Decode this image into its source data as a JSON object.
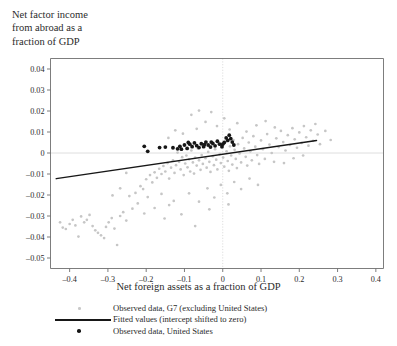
{
  "figure": {
    "y_axis_title_lines": [
      "Net factor income",
      "from abroad as a",
      "fraction of GDP"
    ],
    "x_axis_title": "Net foreign assets as a fraction of GDP"
  },
  "legend": {
    "items": [
      {
        "marker": "gray-dot-marker",
        "label": "Observed data, G7 (excluding United States)"
      },
      {
        "marker": "black-line-marker",
        "label": "Fitted values (intercept shifted to zero)"
      },
      {
        "marker": "black-dot-marker",
        "label": "Observed data, United States"
      }
    ]
  },
  "colors": {
    "g7_points": "#c6c6c6",
    "us_points": "#161616",
    "fit_line": "#171717",
    "axis": "#6e6e6e",
    "gridline": "#dedede"
  },
  "chart_data": {
    "type": "scatter",
    "title": "",
    "xlabel": "Net foreign assets as a fraction of GDP",
    "ylabel": "Net factor income from abroad as a fraction of GDP",
    "xlim": [
      -0.45,
      0.42
    ],
    "ylim": [
      -0.055,
      0.045
    ],
    "xticks": [
      -0.4,
      -0.3,
      -0.2,
      -0.1,
      0,
      0.1,
      0.2,
      0.3,
      0.4
    ],
    "xticklabels": [
      "–0.4",
      "–0.3",
      "–0.2",
      "–0.1",
      "0",
      "0.1",
      "0.2",
      "0.3",
      "0.4"
    ],
    "yticks": [
      0.04,
      0.03,
      0.02,
      0.01,
      0,
      -0.01,
      -0.02,
      -0.03,
      -0.04,
      -0.05
    ],
    "yticklabels": [
      "0.04",
      "0.03",
      "0.02",
      "0.01",
      "0",
      "–0.01",
      "–0.02",
      "–0.03",
      "–0.04",
      "–0.05"
    ],
    "grid": false,
    "zero_lines": {
      "horizontal_y": 0,
      "vertical_x": 0
    },
    "legend_position": "below",
    "series": [
      {
        "name": "Observed data, G7 (excluding United States)",
        "marker": "circle",
        "color": "#c6c6c6",
        "points": [
          [
            -0.425,
            -0.033
          ],
          [
            -0.418,
            -0.0355
          ],
          [
            -0.41,
            -0.0362
          ],
          [
            -0.4,
            -0.0338
          ],
          [
            -0.392,
            -0.0318
          ],
          [
            -0.385,
            -0.0345
          ],
          [
            -0.377,
            -0.0398
          ],
          [
            -0.37,
            -0.0302
          ],
          [
            -0.362,
            -0.033
          ],
          [
            -0.355,
            -0.0318
          ],
          [
            -0.348,
            -0.0295
          ],
          [
            -0.34,
            -0.0348
          ],
          [
            -0.333,
            -0.0368
          ],
          [
            -0.326,
            -0.038
          ],
          [
            -0.318,
            -0.0392
          ],
          [
            -0.31,
            -0.0405
          ],
          [
            -0.305,
            -0.0352
          ],
          [
            -0.298,
            -0.033
          ],
          [
            -0.29,
            -0.031
          ],
          [
            -0.283,
            -0.036
          ],
          [
            -0.276,
            -0.0438
          ],
          [
            -0.268,
            -0.03
          ],
          [
            -0.26,
            -0.0282
          ],
          [
            -0.252,
            -0.0322
          ],
          [
            -0.244,
            -0.0205
          ],
          [
            -0.236,
            -0.0265
          ],
          [
            -0.228,
            -0.019
          ],
          [
            -0.222,
            -0.024
          ],
          [
            -0.215,
            -0.0158
          ],
          [
            -0.208,
            -0.0172
          ],
          [
            -0.2,
            -0.0125
          ],
          [
            -0.196,
            -0.021
          ],
          [
            -0.19,
            -0.0105
          ],
          [
            -0.184,
            -0.014
          ],
          [
            -0.178,
            -0.0092
          ],
          [
            -0.172,
            -0.0118
          ],
          [
            -0.166,
            -0.0075
          ],
          [
            -0.16,
            -0.01
          ],
          [
            -0.155,
            -0.0062
          ],
          [
            -0.15,
            -0.0088
          ],
          [
            -0.144,
            -0.0048
          ],
          [
            -0.14,
            -0.0122
          ],
          [
            -0.135,
            -0.007
          ],
          [
            -0.13,
            -0.0035
          ],
          [
            -0.126,
            -0.0095
          ],
          [
            -0.122,
            -0.0058
          ],
          [
            -0.118,
            0.0002
          ],
          [
            -0.114,
            -0.0042
          ],
          [
            -0.11,
            -0.0078
          ],
          [
            -0.106,
            -0.002
          ],
          [
            -0.102,
            -0.0105
          ],
          [
            -0.098,
            -0.005
          ],
          [
            -0.095,
            -0.0012
          ],
          [
            -0.092,
            -0.0068
          ],
          [
            -0.088,
            -0.003
          ],
          [
            -0.085,
            -0.0088
          ],
          [
            -0.082,
            0.0012
          ],
          [
            -0.078,
            -0.0045
          ],
          [
            -0.075,
            -0.0098
          ],
          [
            -0.072,
            -0.0022
          ],
          [
            -0.068,
            -0.006
          ],
          [
            -0.065,
            0.0022
          ],
          [
            -0.062,
            -0.0035
          ],
          [
            -0.058,
            -0.008
          ],
          [
            -0.055,
            -0.001
          ],
          [
            -0.052,
            -0.0052
          ],
          [
            -0.048,
            0.003
          ],
          [
            -0.045,
            -0.0025
          ],
          [
            -0.042,
            -0.007
          ],
          [
            -0.038,
            0.0005
          ],
          [
            -0.035,
            -0.0042
          ],
          [
            -0.032,
            -0.009
          ],
          [
            -0.029,
            0.0038
          ],
          [
            -0.026,
            -0.0015
          ],
          [
            -0.023,
            -0.0058
          ],
          [
            -0.02,
            0.0018
          ],
          [
            -0.017,
            -0.0032
          ],
          [
            -0.014,
            -0.0078
          ],
          [
            -0.011,
            0.0045
          ],
          [
            -0.008,
            -0.0005
          ],
          [
            -0.005,
            -0.0048
          ],
          [
            -0.002,
            0.0025
          ],
          [
            0.001,
            -0.0022
          ],
          [
            0.004,
            -0.0065
          ],
          [
            0.007,
            0.0052
          ],
          [
            0.01,
            0.0008
          ],
          [
            0.013,
            -0.0038
          ],
          [
            0.016,
            -0.0085
          ],
          [
            0.019,
            0.0032
          ],
          [
            0.022,
            -0.0012
          ],
          [
            0.025,
            -0.0055
          ],
          [
            0.028,
            0.0062
          ],
          [
            0.031,
            0.0015
          ],
          [
            0.034,
            -0.0028
          ],
          [
            0.037,
            -0.0072
          ],
          [
            0.04,
            0.0042
          ],
          [
            0.044,
            -0.0002
          ],
          [
            0.048,
            -0.0045
          ],
          [
            0.052,
            0.0072
          ],
          [
            0.056,
            0.0022
          ],
          [
            0.06,
            -0.0018
          ],
          [
            0.064,
            -0.006
          ],
          [
            0.068,
            0.005
          ],
          [
            0.072,
            0.0008
          ],
          [
            0.076,
            -0.0035
          ],
          [
            0.08,
            0.008
          ],
          [
            0.085,
            0.003
          ],
          [
            0.09,
            -0.001
          ],
          [
            0.095,
            -0.0052
          ],
          [
            0.1,
            0.006
          ],
          [
            0.105,
            0.0018
          ],
          [
            0.11,
            -0.0028
          ],
          [
            0.116,
            0.009
          ],
          [
            0.122,
            0.004
          ],
          [
            0.128,
            0.0
          ],
          [
            0.134,
            -0.0042
          ],
          [
            0.14,
            0.007
          ],
          [
            0.146,
            0.0028
          ],
          [
            0.152,
            0.0105
          ],
          [
            0.158,
            0.0052
          ],
          [
            0.164,
            0.0012
          ],
          [
            0.17,
            0.0085
          ],
          [
            0.176,
            0.0038
          ],
          [
            0.182,
            0.0118
          ],
          [
            0.188,
            0.0065
          ],
          [
            0.194,
            0.0025
          ],
          [
            0.2,
            0.0098
          ],
          [
            0.206,
            0.0048
          ],
          [
            0.212,
            0.0128
          ],
          [
            0.218,
            0.0075
          ],
          [
            0.224,
            0.0035
          ],
          [
            0.23,
            0.0108
          ],
          [
            0.236,
            0.0058
          ],
          [
            0.242,
            0.0138
          ],
          [
            0.248,
            0.0088
          ],
          [
            0.254,
            0.0042
          ],
          [
            -0.082,
            0.0182
          ],
          [
            -0.062,
            0.0202
          ],
          [
            -0.03,
            0.0195
          ],
          [
            -0.045,
            0.0148
          ],
          [
            -0.015,
            0.0128
          ],
          [
            -0.068,
            0.0115
          ],
          [
            0.004,
            0.0165
          ],
          [
            0.018,
            0.0112
          ],
          [
            -0.104,
            0.0092
          ],
          [
            -0.124,
            0.0108
          ],
          [
            -0.142,
            0.0072
          ],
          [
            0.038,
            0.0142
          ],
          [
            0.062,
            0.0102
          ],
          [
            0.088,
            0.0132
          ],
          [
            0.112,
            0.0152
          ],
          [
            0.136,
            0.0122
          ],
          [
            -0.252,
            -0.0095
          ],
          [
            -0.268,
            -0.0168
          ],
          [
            -0.288,
            -0.0202
          ],
          [
            -0.205,
            -0.0288
          ],
          [
            -0.178,
            -0.0262
          ],
          [
            -0.152,
            -0.0312
          ],
          [
            -0.128,
            -0.0228
          ],
          [
            -0.108,
            -0.0292
          ],
          [
            -0.088,
            -0.0192
          ],
          [
            -0.062,
            -0.0232
          ],
          [
            -0.04,
            -0.0168
          ],
          [
            -0.022,
            -0.0212
          ],
          [
            -0.005,
            -0.0152
          ],
          [
            0.012,
            -0.0192
          ],
          [
            0.03,
            -0.0138
          ],
          [
            0.048,
            -0.0172
          ],
          [
            0.07,
            -0.0122
          ],
          [
            0.092,
            -0.0152
          ],
          [
            -0.16,
            -0.0195
          ],
          [
            -0.14,
            -0.0248
          ],
          [
            0.16,
            -0.0048
          ],
          [
            0.185,
            -0.0025
          ],
          [
            0.21,
            -0.0012
          ],
          [
            0.015,
            -0.0245
          ],
          [
            -0.035,
            -0.0268
          ],
          [
            -0.072,
            -0.0348
          ],
          [
            0.268,
            0.0105
          ],
          [
            0.282,
            0.0062
          ]
        ]
      },
      {
        "name": "Observed data, United States",
        "marker": "circle",
        "color": "#161616",
        "points": [
          [
            -0.205,
            0.0032
          ],
          [
            -0.196,
            0.0008
          ],
          [
            -0.15,
            0.0028
          ],
          [
            -0.13,
            0.0025
          ],
          [
            -0.118,
            0.002
          ],
          [
            -0.108,
            0.0018
          ],
          [
            -0.1,
            0.0038
          ],
          [
            -0.093,
            0.0022
          ],
          [
            -0.086,
            0.0042
          ],
          [
            -0.08,
            0.003
          ],
          [
            -0.074,
            0.0048
          ],
          [
            -0.068,
            0.0035
          ],
          [
            -0.062,
            0.0026
          ],
          [
            -0.056,
            0.0044
          ],
          [
            -0.05,
            0.003
          ],
          [
            -0.044,
            0.0052
          ],
          [
            -0.038,
            0.0038
          ],
          [
            -0.032,
            0.0028
          ],
          [
            -0.026,
            0.0046
          ],
          [
            -0.02,
            0.0034
          ],
          [
            -0.014,
            0.0056
          ],
          [
            -0.008,
            0.0042
          ],
          [
            -0.002,
            0.003
          ],
          [
            0.004,
            0.005
          ],
          [
            0.009,
            0.0072
          ],
          [
            0.013,
            0.006
          ],
          [
            0.017,
            0.0085
          ],
          [
            0.021,
            0.0068
          ],
          [
            0.025,
            0.0052
          ],
          [
            0.029,
            0.0038
          ],
          [
            -0.165,
            0.0026
          ],
          [
            -0.112,
            0.0032
          ],
          [
            -0.09,
            0.005
          ],
          [
            -0.048,
            0.004
          ],
          [
            -0.03,
            0.0052
          ],
          [
            0.0,
            0.0042
          ]
        ]
      }
    ],
    "fit_line": {
      "name": "Fitted values (intercept shifted to zero)",
      "x": [
        -0.435,
        0.245
      ],
      "y": [
        -0.0122,
        0.006
      ],
      "color": "#171717"
    }
  }
}
